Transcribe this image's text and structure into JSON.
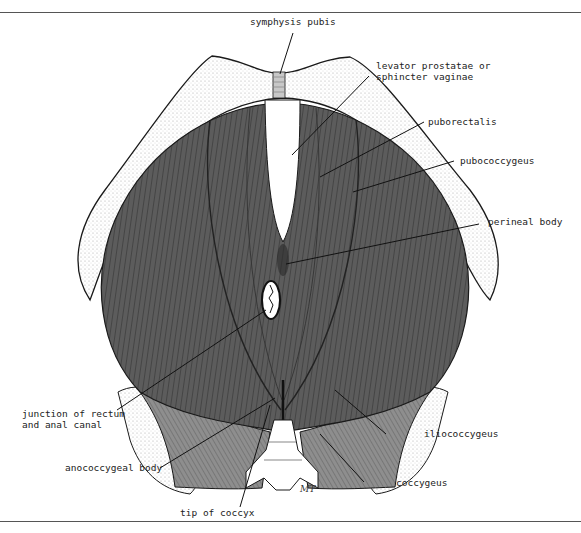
{
  "figure": {
    "type": "anatomical illustration",
    "colors": {
      "muscle_dark": "#5a5a5a",
      "muscle_light": "#8a8a8a",
      "bone": "#ffffff",
      "outline": "#1a1a1a",
      "leader_line": "#111111"
    },
    "labels": [
      {
        "id": "symphysis-pubis",
        "text": "symphysis pubis"
      },
      {
        "id": "levator-prostatae",
        "text": "levator prostatae or\nsphincter vaginae"
      },
      {
        "id": "puborectalis",
        "text": "puborectalis"
      },
      {
        "id": "pubococcygeus",
        "text": "pubococcygeus"
      },
      {
        "id": "perineal-body",
        "text": "perineal body"
      },
      {
        "id": "junction-rectum",
        "text": "junction of rectum\nand anal canal"
      },
      {
        "id": "iliococcygeus",
        "text": "iliococcygeus"
      },
      {
        "id": "anococcygeal-body",
        "text": "anococcygeal body"
      },
      {
        "id": "coccygeus",
        "text": "coccygeus"
      },
      {
        "id": "tip-of-coccyx",
        "text": "tip of coccyx"
      }
    ],
    "signature": "MT"
  }
}
